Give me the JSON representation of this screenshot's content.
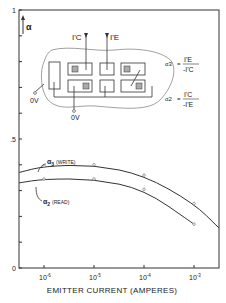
{
  "chart_data": {
    "type": "line",
    "title": "",
    "xlabel": "EMITTER CURRENT (AMPERES)",
    "ylabel": "α",
    "xscale": "log",
    "x_tick_labels": [
      "10^-6",
      "10^-5",
      "10^-4",
      "10^-3"
    ],
    "x_ticks": [
      -6,
      -5,
      -4,
      -3
    ],
    "xlim_log10": [
      -6.5,
      -2.5
    ],
    "y_tick_labels": [
      "0",
      ".5",
      "1"
    ],
    "ylim": [
      0,
      1
    ],
    "y_minor_step": 0.1,
    "grid": false,
    "series": [
      {
        "name": "α3 (WRITE)",
        "label_main": "α",
        "label_sub": "3",
        "label_note": "(WRITE)",
        "x_log10": [
          -6.5,
          -6,
          -5,
          -4,
          -3,
          -2.5
        ],
        "values": [
          0.37,
          0.395,
          0.4,
          0.36,
          0.25,
          0.155
        ],
        "markers_log10": [
          -6,
          -5,
          -4,
          -3
        ]
      },
      {
        "name": "α2 (READ)",
        "label_main": "α",
        "label_sub": "2",
        "label_note": "(READ)",
        "x_log10": [
          -6.5,
          -6,
          -5,
          -4,
          -3
        ],
        "values": [
          0.33,
          0.345,
          0.345,
          0.305,
          0.17
        ],
        "markers_log10": [
          -6,
          -5,
          -4,
          -3
        ]
      }
    ],
    "annotations": {
      "y_axis_symbol": "α",
      "current_labels": [
        "I'C",
        "I'E"
      ],
      "ground_labels": [
        "0V",
        "0V"
      ],
      "formulas": [
        {
          "lhs": "α3",
          "numerator": "I'E",
          "denominator": "-I'C"
        },
        {
          "lhs": "α2",
          "numerator": "I'C",
          "denominator": "-I'E"
        }
      ]
    }
  }
}
